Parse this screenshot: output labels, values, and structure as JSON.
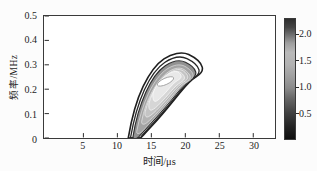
{
  "figure": {
    "type_note": "time-frequency contour figure, printed grayscale",
    "background": "#fcfcfc",
    "frame_color": "#3a3a3a"
  },
  "chart_data": {
    "type": "heatmap",
    "subtype": "contour",
    "title": "",
    "xlabel": "时间/μs",
    "ylabel": "频率/MHz",
    "xlim": [
      -0.8,
      33.2
    ],
    "ylim": [
      0,
      0.5
    ],
    "x_ticks": [
      {
        "v": 5,
        "label": "5"
      },
      {
        "v": 10,
        "label": "10"
      },
      {
        "v": 15,
        "label": "15"
      },
      {
        "v": 20,
        "label": "20"
      },
      {
        "v": 25,
        "label": "25"
      },
      {
        "v": 30,
        "label": "30"
      }
    ],
    "y_ticks": [
      {
        "v": 0,
        "label": "0"
      },
      {
        "v": 0.1,
        "label": "0.1"
      },
      {
        "v": 0.2,
        "label": "0.2"
      },
      {
        "v": 0.3,
        "label": "0.3"
      },
      {
        "v": 0.4,
        "label": "0.4"
      },
      {
        "v": 0.5,
        "label": "0.5"
      }
    ],
    "grid": false,
    "ridge_peak": {
      "time_us": 16.7,
      "freq_MHz": 0.25,
      "value_approx": 2.2
    },
    "ridge_extent": {
      "time_us": [
        11.3,
        22.5
      ],
      "freq_MHz": [
        0,
        0.35
      ]
    },
    "plot_px": {
      "w": 233,
      "h": 124
    },
    "contours": [
      {
        "level": 0.25,
        "fill": "none",
        "stroke": "#1f1f1f",
        "w": 1.6,
        "tx": 0,
        "ty": 0,
        "path": "M 85,124 C 88,106 93.5,85 100,71.5 C 106.5,58 113.5,48.5 121,43.5 C 129,38.2 139,35.8 146,39.2 C 153,42.6 158.5,47.8 159.6,52 C 160.7,56.2 157.6,59.3 153.4,61.8 C 148.6,64.7 143.6,70 138,77 C 131,85.8 122.5,96.5 114.5,105.5 C 108.5,112.2 102.5,118.6 97.5,124 Z"
      },
      {
        "level": 0.5,
        "fill": "none",
        "stroke": "#262626",
        "w": 1.3,
        "tx": 0,
        "ty": 0,
        "path": "M 87.2,124 C 90,108 95,89 101.3,75 C 107.5,61.5 114.5,52 121.7,47.2 C 129.2,42.3 138,40.3 144.2,43.3 C 150.4,46.3 155.2,50.8 156.2,54.4 C 157.2,58 154.6,60.7 150.9,63 C 146.6,65.6 142,70.5 136.7,77.2 C 130.2,85.4 122.3,95.2 114.8,103.6 C 109.3,109.8 103.7,115.9 99,121.3 C 98.2,122.2 97.7,123.1 97.4,124 Z"
      },
      {
        "level": 0.75,
        "fill": "#929292",
        "stroke": "#303030",
        "w": 1.2,
        "tx": 0,
        "ty": 0,
        "path": "M 89.8,122.5 C 92,108.5 96.5,91.5 102.7,77.5 C 108.7,64 115.5,55 122.3,50.5 C 129.5,45.8 137.2,44.3 142.7,47 C 148.2,49.7 152.2,53.6 153,56.7 C 153.8,59.8 151.5,62.3 148.3,64.3 C 144.2,66.8 139.7,71.4 134.7,77.7 C 128.7,85.2 121.3,94.2 114.3,102 C 109,107.9 103,114.6 95.5,122.8 C 92.8,125.6 89.3,125.5 89.8,122.5 Z"
      },
      {
        "level": 1.0,
        "fill": "#a4a4a4",
        "stroke": "#d8d8d8",
        "w": 0.8,
        "tx": 0,
        "ty": 0,
        "path": "M 93.5,117.5 C 96,104 100,90 105.5,78.5 C 111,67 117.3,58.3 124,53.9 C 130.7,49.5 137.3,48.5 142,51.1 C 146.7,53.7 149.8,57 150.3,59.6 C 150.8,62.2 148.8,64.5 145.7,66.4 C 141.9,68.7 137.5,73 132.7,79 C 127,86.1 120.3,94.1 113.9,101.2 C 109.4,106.2 104,112 100,116.5 C 96.8,120.1 93,120.5 93.5,117.5 Z"
      },
      {
        "level": 1.25,
        "fill": "#b4b4b4",
        "stroke": "#e2e2e2",
        "w": 0.8,
        "tx": 0,
        "ty": -1,
        "path": "M 98.5,108 C 100.5,97.5 104,87 109,78 C 114,69 120,61.5 125.8,57.6 C 131.6,53.7 137.4,53 141.2,55.4 C 145,57.8 147.2,60.5 147.5,62.6 C 147.8,64.7 146,66.6 143.2,68.4 C 139.8,70.5 135.8,74.3 131.3,79.7 C 126.3,85.7 120.7,92.2 115.4,97.9 C 111.9,101.7 107,106.8 103.5,109.6 C 100.3,112.1 98,111 98.5,108 Z"
      },
      {
        "level": 1.5,
        "fill": "#c4c4c4",
        "stroke": "#ececec",
        "w": 0.8,
        "tx": -1,
        "ty": -2,
        "path": "M 103,99.5 C 105,91 108.5,83 113,76 C 117.7,68.8 123,62.8 128.2,59.4 C 133.4,56 138.3,55.6 141.4,57.7 C 144.5,59.8 146,62.2 146.1,64 C 146.2,65.8 144.6,67.5 142,69.1 C 138.9,71 135.2,74.4 131,79.4 C 126.5,84.8 121.6,90.4 116.9,95.3 C 113.6,98.7 109.5,102.8 106.4,104.3 C 103.5,105.7 102.4,102.8 103,99.5 Z"
      },
      {
        "level": 1.75,
        "fill": "#d6d6d6",
        "stroke": "#f4f4f4",
        "w": 0.8,
        "tx": -2,
        "ty": -3,
        "path": "M 108,91.5 C 109.6,85.5 112.3,79.8 116,74.5 C 119.9,69 124.5,64.3 129,61.6 C 133.5,58.9 137.6,58.8 140.1,60.6 C 142.6,62.4 143.8,64.4 143.7,66 C 143.6,67.6 142.1,69.1 139.8,70.5 C 137.1,72.2 133.8,75.1 130.2,79.4 C 126.5,83.8 122.5,88.3 118.7,92.2 C 116.2,94.8 112.9,98 110.4,98.7 C 108,99.4 107.3,95.2 108,91.5 Z"
      },
      {
        "level": 2.0,
        "fill": "#e8e8e8",
        "stroke": "#fafafa",
        "w": 0.8,
        "tx": -3,
        "ty": -5,
        "path": "M 113,83.5 C 114.3,79.3 116.5,75.2 119.6,71.5 C 122.8,67.7 126.7,64.5 130.5,62.7 C 134.3,60.9 137.4,61.1 139.1,62.6 C 140.8,64.1 141.5,65.7 141.3,66.9 C 141.1,68.1 139.8,69.3 137.9,70.4 C 135.7,71.7 133,74.1 130.1,77.6 C 127.2,81.1 124,84.7 121.1,87.6 C 119.1,89.6 116.6,91.9 115,91.8 C 113.3,91.7 112.4,87.7 113,83.5 Z"
      }
    ],
    "core": {
      "level": 2.2,
      "cx": 122.5,
      "cy": 66.5,
      "rx": 9,
      "ry": 3.2,
      "rot": -25,
      "fill": "#ffffff",
      "stroke": "#9a9a9a",
      "w": 0.8
    },
    "colorbar": {
      "range": [
        0,
        2.3
      ],
      "ticks": [
        {
          "v": 2.0,
          "label": "2.0"
        },
        {
          "v": 1.5,
          "label": "1.5"
        },
        {
          "v": 1.0,
          "label": "1.0"
        },
        {
          "v": 0.5,
          "label": "0.5"
        }
      ],
      "stops": [
        {
          "pos": 0,
          "color": "#2e2e2e"
        },
        {
          "pos": 0.07,
          "color": "#454545"
        },
        {
          "pos": 0.13,
          "color": "#6e6e6e"
        },
        {
          "pos": 0.2,
          "color": "#9e9e9e"
        },
        {
          "pos": 0.28,
          "color": "#bababa"
        },
        {
          "pos": 0.38,
          "color": "#b2b2b2"
        },
        {
          "pos": 0.5,
          "color": "#9b9b9b"
        },
        {
          "pos": 0.575,
          "color": "#8a8a8a"
        },
        {
          "pos": 0.66,
          "color": "#676767"
        },
        {
          "pos": 0.78,
          "color": "#414141"
        },
        {
          "pos": 0.9,
          "color": "#222222"
        },
        {
          "pos": 1,
          "color": "#0e0e0e"
        }
      ]
    },
    "tick_color": "#2a2a2a"
  }
}
